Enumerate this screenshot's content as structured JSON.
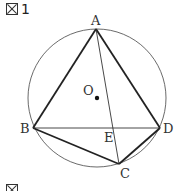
{
  "figure": {
    "label": "1",
    "label_icon": "figure-icon",
    "next_label": ""
  },
  "points": {
    "A": "A",
    "B": "B",
    "C": "C",
    "D": "D",
    "E": "E",
    "O": "O"
  },
  "geometry": {
    "circle": {
      "cx": 97,
      "cy": 98,
      "r": 69
    },
    "A": [
      96,
      29
    ],
    "B": [
      33,
      128
    ],
    "C": [
      119,
      164
    ],
    "D": [
      160,
      128
    ],
    "E": [
      113,
      128
    ],
    "O": [
      97,
      98
    ]
  }
}
